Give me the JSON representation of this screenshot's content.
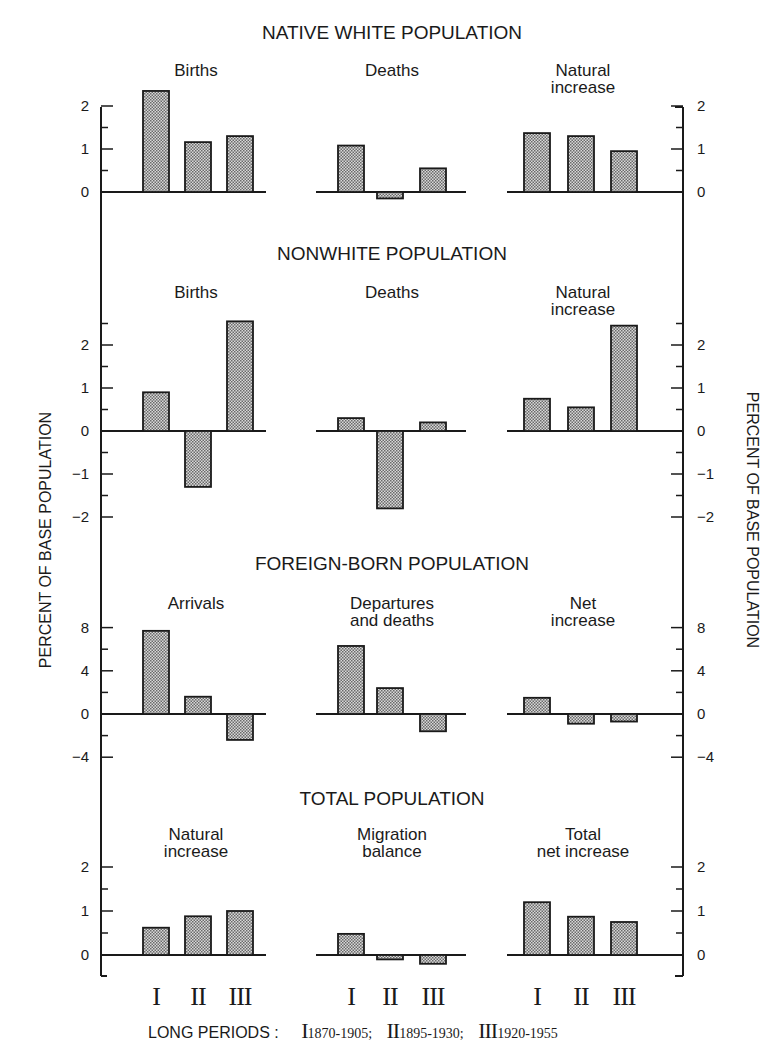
{
  "left_axis_label": "PERCENT OF BASE POPULATION",
  "right_axis_label": "PERCENT OF BASE POPULATION",
  "period_labels": [
    "I",
    "II",
    "III"
  ],
  "legend": {
    "lead": "LONG PERIODS :",
    "items": [
      {
        "numeral": "I",
        "years": "1870-1905;"
      },
      {
        "numeral": "II",
        "years": "1895-1930;"
      },
      {
        "numeral": "III",
        "years": "1920-1955"
      }
    ]
  },
  "chart_data": [
    {
      "type": "bar",
      "section": "NATIVE WHITE POPULATION",
      "ylabel": "Percent of base population",
      "ylim": [
        -0.4,
        2
      ],
      "yticks": [
        0,
        1,
        2
      ],
      "categories": [
        "I",
        "II",
        "III"
      ],
      "panels": [
        {
          "title": "Births",
          "values": [
            2.35,
            1.16,
            1.3
          ]
        },
        {
          "title": "Deaths",
          "values": [
            1.08,
            -0.15,
            0.55
          ]
        },
        {
          "title": "Natural\nincrease",
          "values": [
            1.37,
            1.3,
            0.95
          ]
        }
      ]
    },
    {
      "type": "bar",
      "section": "NONWHITE POPULATION",
      "ylabel": "Percent of base population",
      "ylim": [
        -2,
        2.5
      ],
      "yticks": [
        -2,
        -1,
        0,
        1,
        2
      ],
      "categories": [
        "I",
        "II",
        "III"
      ],
      "panels": [
        {
          "title": "Births",
          "values": [
            0.9,
            -1.3,
            2.55
          ]
        },
        {
          "title": "Deaths",
          "values": [
            0.3,
            -1.8,
            0.2
          ]
        },
        {
          "title": "Natural\nincrease",
          "values": [
            0.75,
            0.55,
            2.45
          ]
        }
      ]
    },
    {
      "type": "bar",
      "section": "FOREIGN-BORN POPULATION",
      "ylabel": "Percent of base population",
      "ylim": [
        -4,
        8
      ],
      "yticks": [
        -4,
        0,
        4,
        8
      ],
      "categories": [
        "I",
        "II",
        "III"
      ],
      "panels": [
        {
          "title": "Arrivals",
          "values": [
            7.7,
            1.6,
            -2.4
          ]
        },
        {
          "title": "Departures\nand deaths",
          "values": [
            6.3,
            2.4,
            -1.6
          ]
        },
        {
          "title": "Net\nincrease",
          "values": [
            1.5,
            -0.9,
            -0.7
          ]
        }
      ]
    },
    {
      "type": "bar",
      "section": "TOTAL POPULATION",
      "ylabel": "Percent of base population",
      "ylim": [
        -0.4,
        2
      ],
      "yticks": [
        0,
        1,
        2
      ],
      "categories": [
        "I",
        "II",
        "III"
      ],
      "panels": [
        {
          "title": "Natural\nincrease",
          "values": [
            0.62,
            0.88,
            1.0
          ]
        },
        {
          "title": "Migration\nbalance",
          "values": [
            0.48,
            -0.1,
            -0.2
          ]
        },
        {
          "title": "Total\nnet increase",
          "values": [
            1.2,
            0.87,
            0.75
          ]
        }
      ]
    }
  ]
}
